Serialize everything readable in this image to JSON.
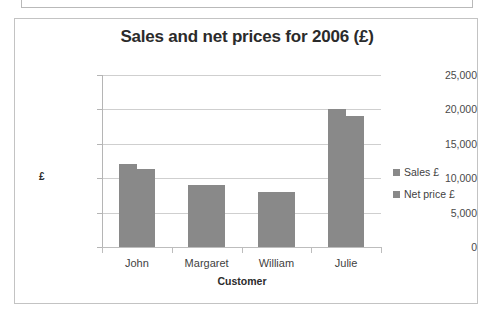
{
  "top_clip": {
    "text": ""
  },
  "chart": {
    "title": "Sales and net prices for 2006 (£)",
    "bar_color": "#898989",
    "gridline_color": "#cfcfcf",
    "axis_color": "#bdbdbd",
    "title_color": "#2b2b2b"
  },
  "legend": {
    "items": [
      {
        "label": "Sales £",
        "color": "#898989"
      },
      {
        "label": "Net price £",
        "color": "#898989"
      }
    ]
  },
  "chart_data": {
    "type": "bar",
    "title": "Sales and net prices for 2006 (£)",
    "xlabel": "Customer",
    "ylabel": "£",
    "categories": [
      "John",
      "Margaret",
      "William",
      "Julie"
    ],
    "series": [
      {
        "name": "Sales £",
        "values": [
          12000,
          9000,
          8000,
          20100
        ]
      },
      {
        "name": "Net price £",
        "values": [
          11400,
          9000,
          8000,
          19100
        ]
      }
    ],
    "ylim": [
      0,
      25000
    ],
    "ytick_labels": [
      "25,000",
      "20,000",
      "15,000",
      "10,000",
      "5,000",
      "0"
    ],
    "ytick_values": [
      25000,
      20000,
      15000,
      10000,
      5000,
      0
    ],
    "ytick_step": 5000,
    "grid": true,
    "legend_position": "right",
    "bar_orientation": "vertical",
    "grouped": true
  }
}
